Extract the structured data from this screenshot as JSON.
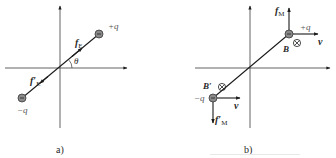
{
  "figure": {
    "panels": [
      {
        "id": "a",
        "caption": "a)",
        "labels": {
          "plus_charge": "+q",
          "minus_charge": "−q",
          "force": "f",
          "force_sub": "E",
          "force_prime": "f′",
          "force_prime_sub": "E",
          "angle": "θ"
        }
      },
      {
        "id": "b",
        "caption": "b)",
        "labels": {
          "plus_charge": "+q",
          "minus_charge": "−q",
          "force": "f",
          "force_sub": "M",
          "force_prime": "f′",
          "force_prime_sub": "M",
          "velocity_top": "v",
          "velocity_bottom": "v",
          "field": "B",
          "field_prime": "B′",
          "field_symbol": "⊗"
        }
      }
    ],
    "colors": {
      "line": "#1a1a1a",
      "axis": "#3a3a3a",
      "charge_fill": "#8a8a8a",
      "charge_stroke": "#3a3a3a",
      "text": "#2a2a2a"
    }
  }
}
